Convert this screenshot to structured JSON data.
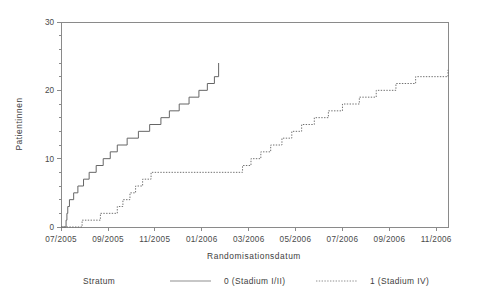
{
  "chart_data": {
    "type": "line",
    "title": "",
    "xlabel": "Randomisationsdatum",
    "ylabel": "Patientinnen",
    "grid": false,
    "legend_position": "bottom",
    "legend_title": "Stratum",
    "xlim": [
      2005.5,
      2006.875
    ],
    "ylim": [
      0,
      30
    ],
    "yticks": [
      0,
      10,
      20,
      30
    ],
    "ytick_labels": [
      "0",
      "10",
      "20",
      "30"
    ],
    "xticks": [
      2005.5,
      2005.667,
      2005.833,
      2006.0,
      2006.167,
      2006.333,
      2006.5,
      2006.667,
      2006.833
    ],
    "xtick_labels": [
      "07/2005",
      "09/2005",
      "11/2005",
      "01/2006",
      "03/2006",
      "05/2006",
      "07/2006",
      "09/2006",
      "11/2006"
    ],
    "series": [
      {
        "name": "0 (Stadium I/II)",
        "style": "solid",
        "color": "#666666",
        "step": "post",
        "x": [
          2005.5,
          2005.515,
          2005.518,
          2005.521,
          2005.524,
          2005.53,
          2005.545,
          2005.56,
          2005.58,
          2005.6,
          2005.625,
          2005.65,
          2005.675,
          2005.7,
          2005.735,
          2005.775,
          2005.815,
          2005.855,
          2005.885,
          2005.92,
          2005.955,
          2005.99,
          2006.02,
          2006.045,
          2006.06
        ],
        "y": [
          0,
          0,
          1,
          2,
          3,
          4,
          5,
          6,
          7,
          8,
          9,
          10,
          11,
          12,
          13,
          14,
          15,
          16,
          17,
          18,
          19,
          20,
          21,
          22,
          24
        ],
        "final_value": 24
      },
      {
        "name": "1 (Stadium IV)",
        "style": "dotted",
        "color": "#707070",
        "step": "post",
        "x": [
          2005.5,
          2005.545,
          2005.575,
          2005.64,
          2005.7,
          2005.72,
          2005.745,
          2005.765,
          2005.79,
          2005.82,
          2006.105,
          2006.145,
          2006.175,
          2006.21,
          2006.245,
          2006.285,
          2006.32,
          2006.355,
          2006.4,
          2006.45,
          2006.5,
          2006.56,
          2006.62,
          2006.69,
          2006.76,
          2006.875
        ],
        "y": [
          0,
          0,
          1,
          2,
          3,
          4,
          5,
          6,
          7,
          8,
          8,
          9,
          10,
          11,
          12,
          13,
          14,
          15,
          16,
          17,
          18,
          19,
          20,
          21,
          22,
          23
        ],
        "final_value": 23
      }
    ]
  },
  "legend": {
    "title": "Stratum",
    "entries": [
      {
        "label": "0 (Stadium I/II)",
        "style": "solid"
      },
      {
        "label": "1 (Stadium IV)",
        "style": "dotted"
      }
    ]
  }
}
